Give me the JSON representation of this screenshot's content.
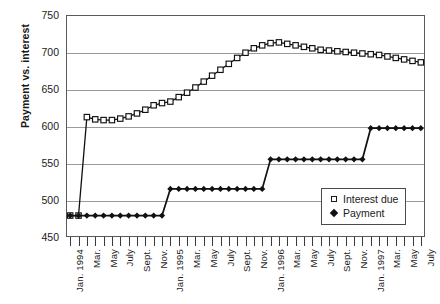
{
  "chart_data": {
    "type": "line",
    "title": "",
    "xlabel": "",
    "ylabel": "Payment vs. interest",
    "ylim": [
      450,
      750
    ],
    "yticks": [
      450,
      500,
      550,
      600,
      650,
      700,
      750
    ],
    "grid": true,
    "legend_position": "bottom-right",
    "x": [
      "Jan. 1994",
      "Feb.",
      "Mar.",
      "Apr.",
      "May",
      "June",
      "July",
      "Aug.",
      "Sept.",
      "Oct.",
      "Nov.",
      "Dec.",
      "Jan. 1995",
      "Feb.",
      "Mar.",
      "Apr.",
      "May",
      "June",
      "July",
      "Aug.",
      "Sept.",
      "Oct.",
      "Nov.",
      "Dec.",
      "Jan. 1996",
      "Feb.",
      "Mar.",
      "Apr.",
      "May",
      "June",
      "July",
      "Aug.",
      "Sept.",
      "Oct.",
      "Nov.",
      "Dec.",
      "Jan. 1997",
      "Feb.",
      "Mar.",
      "Apr.",
      "May",
      "June",
      "July"
    ],
    "xtick_labels": [
      "Jan. 1994",
      "",
      "Mar.",
      "",
      "May",
      "",
      "July",
      "",
      "Sept.",
      "",
      "Nov.",
      "",
      "Jan. 1995",
      "",
      "Mar.",
      "",
      "May",
      "",
      "July",
      "",
      "Sept.",
      "",
      "Nov.",
      "",
      "Jan. 1996",
      "",
      "Mar.",
      "",
      "May",
      "",
      "July",
      "",
      "Sept.",
      "",
      "Nov.",
      "",
      "Jan. 1997",
      "",
      "Mar.",
      "",
      "May",
      "",
      "July"
    ],
    "series": [
      {
        "name": "Interest due",
        "marker": "open-square",
        "values": [
          479,
          479,
          612,
          609,
          608,
          608,
          610,
          613,
          617,
          622,
          628,
          631,
          633,
          639,
          645,
          652,
          660,
          668,
          676,
          684,
          692,
          699,
          705,
          709,
          712,
          713,
          711,
          709,
          707,
          705,
          703,
          702,
          701,
          700,
          699,
          698,
          697,
          696,
          694,
          692,
          690,
          688,
          686
        ]
      },
      {
        "name": "Payment",
        "marker": "filled-diamond",
        "values": [
          479,
          479,
          479,
          479,
          479,
          479,
          479,
          479,
          479,
          479,
          479,
          479,
          515,
          515,
          515,
          515,
          515,
          515,
          515,
          515,
          515,
          515,
          515,
          515,
          555,
          555,
          555,
          555,
          555,
          555,
          555,
          555,
          555,
          555,
          555,
          555,
          597,
          597,
          597,
          597,
          597,
          597,
          597
        ]
      }
    ],
    "legend": [
      {
        "label": "Interest due",
        "marker": "open-square"
      },
      {
        "label": "Payment",
        "marker": "filled-diamond"
      }
    ]
  }
}
